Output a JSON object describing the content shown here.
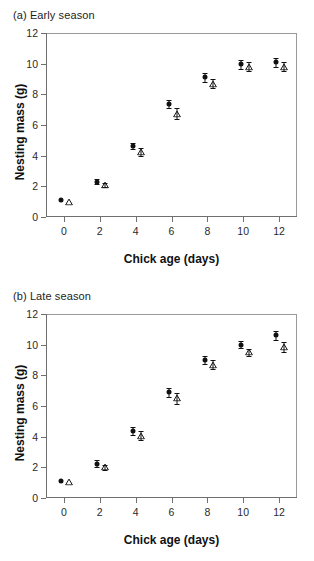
{
  "figure": {
    "xlabel": "Chick age (days)",
    "ylabel": "Nesting mass (g)"
  },
  "panels": [
    {
      "id": "a",
      "title": "(a) Early season"
    },
    {
      "id": "b",
      "title": "(b) Late season"
    }
  ],
  "axis": {
    "x_ticks": [
      "0",
      "2",
      "4",
      "6",
      "8",
      "10",
      "12"
    ],
    "y_ticks": [
      "12",
      "10",
      "8",
      "6",
      "4",
      "2",
      "0"
    ]
  },
  "chart_data": [
    {
      "type": "scatter",
      "title": "(a) Early season",
      "xlabel": "Chick age (days)",
      "ylabel": "Nesting mass (g)",
      "xlim": [
        -1,
        13
      ],
      "ylim": [
        0,
        12
      ],
      "xticks": [
        0,
        2,
        4,
        6,
        8,
        10,
        12
      ],
      "yticks": [
        0,
        2,
        4,
        6,
        8,
        10,
        12
      ],
      "grid": false,
      "legend": "none",
      "x": [
        0,
        2,
        4,
        6,
        8,
        10,
        12
      ],
      "series": [
        {
          "name": "filled-circle",
          "marker": "filled circle",
          "x_offset": -0.15,
          "values": [
            1.1,
            2.3,
            4.65,
            7.35,
            9.1,
            9.95,
            10.1
          ],
          "errors": [
            0.0,
            0.15,
            0.2,
            0.25,
            0.3,
            0.3,
            0.3
          ]
        },
        {
          "name": "open-triangle",
          "marker": "open triangle",
          "x_offset": 0.3,
          "values": [
            0.95,
            2.1,
            4.25,
            6.75,
            8.7,
            9.8,
            9.8
          ],
          "errors": [
            0.0,
            0.15,
            0.25,
            0.35,
            0.3,
            0.3,
            0.3
          ]
        }
      ]
    },
    {
      "type": "scatter",
      "title": "(b) Late season",
      "xlabel": "Chick age (days)",
      "ylabel": "Nesting mass (g)",
      "xlim": [
        -1,
        13
      ],
      "ylim": [
        0,
        12
      ],
      "xticks": [
        0,
        2,
        4,
        6,
        8,
        10,
        12
      ],
      "yticks": [
        0,
        2,
        4,
        6,
        8,
        10,
        12
      ],
      "grid": false,
      "legend": "none",
      "x": [
        0,
        2,
        4,
        6,
        8,
        10,
        12
      ],
      "series": [
        {
          "name": "filled-circle",
          "marker": "filled circle",
          "x_offset": -0.15,
          "values": [
            1.1,
            2.25,
            4.35,
            6.9,
            9.0,
            10.0,
            10.6
          ],
          "errors": [
            0.0,
            0.2,
            0.25,
            0.3,
            0.25,
            0.25,
            0.3
          ]
        },
        {
          "name": "open-triangle",
          "marker": "open triangle",
          "x_offset": 0.3,
          "values": [
            1.05,
            2.0,
            4.05,
            6.5,
            8.7,
            9.5,
            9.85
          ],
          "errors": [
            0.0,
            0.15,
            0.3,
            0.35,
            0.3,
            0.25,
            0.3
          ]
        }
      ]
    }
  ]
}
